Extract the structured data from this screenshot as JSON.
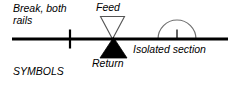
{
  "diagram": {
    "caption": "SYMBOLS",
    "labels": {
      "break": "Break, both\nrails",
      "feed": "Feed",
      "return": "Return",
      "isolated": "Isolated section"
    },
    "colors": {
      "line": "#000000",
      "fill_solid": "#000000",
      "fill_hollow": "#ffffff",
      "arc_stroke": "#6f6f6f",
      "background": "#ffffff",
      "text": "#000000"
    },
    "geometry": {
      "track_line": {
        "x1": 12,
        "y1": 39,
        "x2": 228,
        "y2": 39,
        "width": 2.6
      },
      "break_tick": {
        "x": 70,
        "y_top": 30,
        "y_bottom": 48,
        "width": 2.2
      },
      "feed_triangle": {
        "x_left": 100,
        "x_right": 125,
        "y_top": 16,
        "apex_x": 112.5,
        "apex_y": 39,
        "direction": "down",
        "filled": false
      },
      "return_triangle": {
        "x_left": 100,
        "x_right": 127,
        "y_bottom": 58,
        "apex_x": 113.5,
        "apex_y": 38,
        "direction": "up",
        "filled": true
      },
      "isolated_arc": {
        "cx": 177,
        "cy": 38,
        "r": 19,
        "start_angle": 180,
        "end_angle": 0
      },
      "isolated_tick": {
        "x": 177,
        "y_top": 30,
        "y_bottom": 40,
        "width": 1.6
      }
    }
  }
}
